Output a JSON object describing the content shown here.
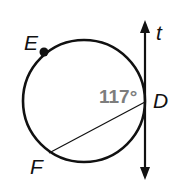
{
  "diagram": {
    "points": {
      "E": "E",
      "D": "D",
      "F": "F"
    },
    "line_label": "t",
    "angle_label": "117°",
    "colors": {
      "stroke": "#111111",
      "angle_text": "#7d7d7d"
    }
  }
}
